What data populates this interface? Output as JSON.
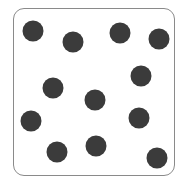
{
  "diagram": {
    "dot_count": 12,
    "dot_color": "#3b3b3b",
    "border_color": "#8a8a8a",
    "dots": [
      {
        "x": 33,
        "y": 31
      },
      {
        "x": 73,
        "y": 42
      },
      {
        "x": 120,
        "y": 33
      },
      {
        "x": 159,
        "y": 39
      },
      {
        "x": 141,
        "y": 76
      },
      {
        "x": 53,
        "y": 88
      },
      {
        "x": 95,
        "y": 100
      },
      {
        "x": 31,
        "y": 121
      },
      {
        "x": 139,
        "y": 118
      },
      {
        "x": 57,
        "y": 152
      },
      {
        "x": 96,
        "y": 146
      },
      {
        "x": 157,
        "y": 158
      }
    ]
  }
}
